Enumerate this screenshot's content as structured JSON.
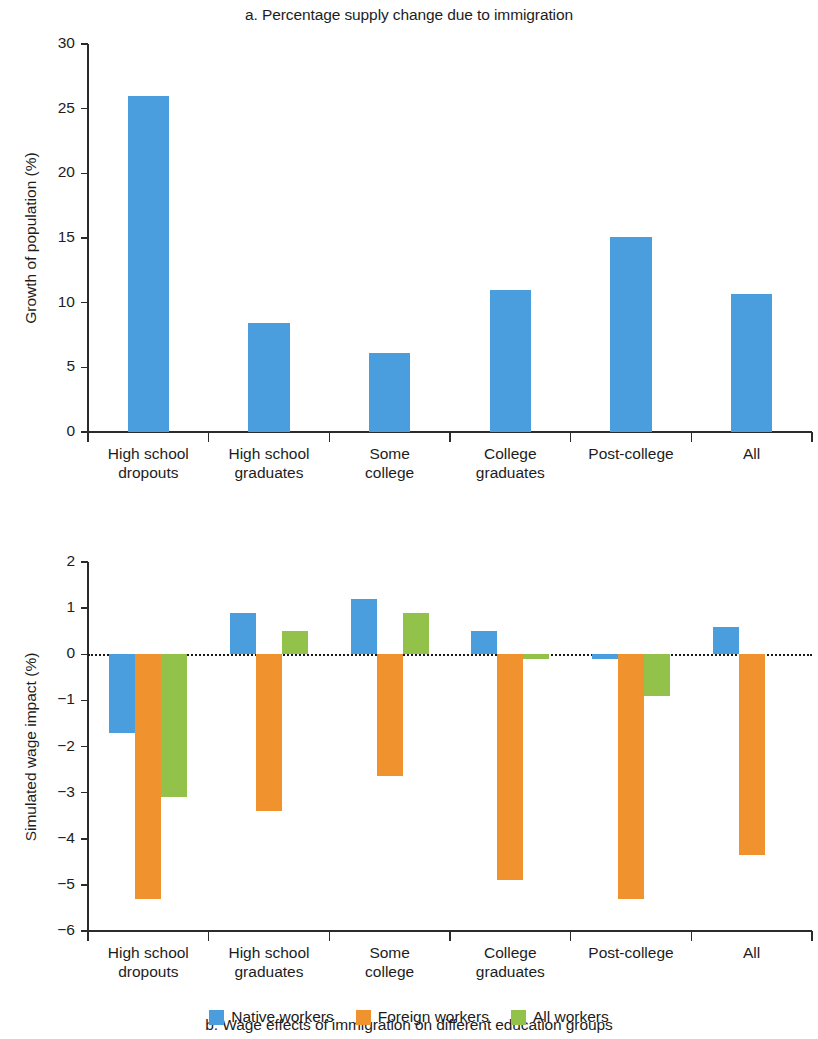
{
  "figure": {
    "legend": [
      {
        "label": "Native workers",
        "color": "#4a9ede"
      },
      {
        "label": "Foreign workers",
        "color": "#f0922e"
      },
      {
        "label": "All workers",
        "color": "#93c24a"
      }
    ]
  },
  "chart_data": [
    {
      "type": "bar",
      "title": "a. Percentage supply change due to immigration",
      "xlabel": "",
      "ylabel": "Growth of population (%)",
      "categories": [
        "High school\ndropouts",
        "High school\ngraduates",
        "Some\ncollege",
        "College\ngraduates",
        "Post-college",
        "All"
      ],
      "category_lines": [
        [
          "High school",
          "dropouts"
        ],
        [
          "High school",
          "graduates"
        ],
        [
          "Some",
          "college"
        ],
        [
          "College",
          "graduates"
        ],
        [
          "Post-college",
          ""
        ],
        [
          "All",
          ""
        ]
      ],
      "values": [
        26.0,
        8.4,
        6.1,
        11.0,
        15.1,
        10.7
      ],
      "series": [
        {
          "name": "Growth of population",
          "color": "#4a9ede",
          "values": [
            26.0,
            8.4,
            6.1,
            11.0,
            15.1,
            10.7
          ]
        }
      ],
      "ylim": [
        0,
        30
      ],
      "yticks": [
        0,
        5,
        10,
        15,
        20,
        25,
        30
      ],
      "ytick_labels": [
        "0",
        "5",
        "10",
        "15",
        "20",
        "25",
        "30"
      ],
      "grid": false,
      "legend_position": "none"
    },
    {
      "type": "bar",
      "title": "b. Wage effects of immigration on different education groups",
      "xlabel": "",
      "ylabel": "Simulated wage impact (%)",
      "categories": [
        "High school\ndropouts",
        "High school\ngraduates",
        "Some\ncollege",
        "College\ngraduates",
        "Post-college",
        "All"
      ],
      "category_lines": [
        [
          "High school",
          "dropouts"
        ],
        [
          "High school",
          "graduates"
        ],
        [
          "Some",
          "college"
        ],
        [
          "College",
          "graduates"
        ],
        [
          "Post-college",
          ""
        ],
        [
          "All",
          ""
        ]
      ],
      "series": [
        {
          "name": "Native workers",
          "color": "#4a9ede",
          "values": [
            -1.7,
            0.9,
            1.2,
            0.5,
            -0.1,
            0.6
          ]
        },
        {
          "name": "Foreign workers",
          "color": "#f0922e",
          "values": [
            -5.3,
            -3.4,
            -2.65,
            -4.9,
            -5.3,
            -4.35
          ]
        },
        {
          "name": "All workers",
          "color": "#93c24a",
          "values": [
            -3.1,
            0.5,
            0.9,
            -0.1,
            -0.9,
            0.0
          ]
        }
      ],
      "ylim": [
        -6,
        2
      ],
      "yticks": [
        2,
        1,
        0,
        -1,
        -2,
        -3,
        -4,
        -5,
        -6
      ],
      "ytick_labels": [
        "2",
        "1",
        "0",
        "−1",
        "−2",
        "−3",
        "−4",
        "−5",
        "−6"
      ],
      "grid": false,
      "zero_line": true,
      "legend_position": "bottom"
    }
  ]
}
